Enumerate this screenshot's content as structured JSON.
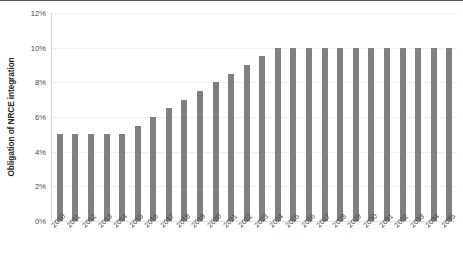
{
  "chart_data": {
    "type": "bar",
    "title": "",
    "xlabel": "",
    "ylabel": "Obligation of NRCE integration",
    "ylim": [
      0,
      12
    ],
    "yunit": "%",
    "ytick_labels": [
      "0%",
      "2%",
      "4%",
      "6%",
      "8%",
      "10%",
      "12%"
    ],
    "ytick_values": [
      0,
      2,
      4,
      6,
      8,
      10,
      12
    ],
    "grid": true,
    "legend": "none",
    "bar_color": "#808080",
    "gridline_color": "#eeeeee",
    "categories": [
      "2010",
      "2011",
      "2012",
      "2013",
      "2014",
      "2015",
      "2016",
      "2017",
      "2018",
      "2019",
      "2020",
      "2021",
      "2022",
      "2023",
      "2024",
      "2025",
      "2026",
      "2027",
      "2028",
      "2029",
      "2030",
      "2031",
      "2032",
      "2033",
      "2034",
      "2035"
    ],
    "values": [
      5,
      5,
      5,
      5,
      5,
      5.5,
      6,
      6.5,
      7,
      7.5,
      8,
      8.5,
      9,
      9.5,
      10,
      10,
      10,
      10,
      10,
      10,
      10,
      10,
      10,
      10,
      10,
      10
    ]
  }
}
